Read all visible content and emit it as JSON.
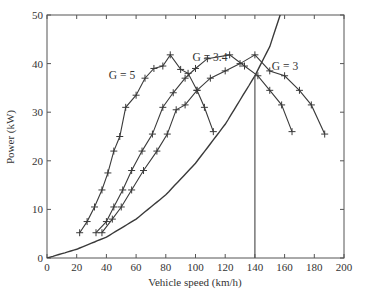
{
  "chart_data": {
    "type": "line",
    "title": "",
    "xlabel": "Vehicle speed (km/h)",
    "ylabel": "Power (kW)",
    "xlim": [
      0,
      200
    ],
    "ylim": [
      0,
      50
    ],
    "xticks": [
      0,
      20,
      40,
      60,
      80,
      100,
      120,
      140,
      160,
      180,
      200
    ],
    "yticks": [
      0,
      10,
      20,
      30,
      40,
      50
    ],
    "grid": false,
    "legend": "none (curves labeled inline)",
    "series": [
      {
        "name": "G = 5",
        "label": "G = 5",
        "marker": "+",
        "x": [
          22,
          27,
          32,
          37,
          41,
          45,
          49,
          53,
          60,
          66,
          72,
          78,
          83,
          90,
          95,
          101,
          106,
          112
        ],
        "y": [
          5.2,
          7.5,
          10.5,
          14,
          17.5,
          22,
          25,
          31,
          33.5,
          37,
          39,
          39.5,
          41.8,
          38.8,
          38,
          34.5,
          31,
          26
        ]
      },
      {
        "name": "G = 3.4",
        "label": "G = 3.4",
        "marker": "+",
        "x": [
          33,
          40,
          45,
          51,
          57,
          64,
          71,
          78,
          85,
          93,
          100,
          108,
          123,
          133,
          142,
          150,
          158,
          165
        ],
        "y": [
          5.2,
          7.5,
          10.5,
          14,
          18,
          22,
          25.5,
          31,
          34,
          37,
          39,
          41,
          41.8,
          39.5,
          37.5,
          34.5,
          31.5,
          26
        ]
      },
      {
        "name": "G = 3",
        "label": "G = 3",
        "marker": "+",
        "x": [
          37,
          44,
          50,
          57,
          65,
          74,
          81,
          87,
          93,
          101,
          110,
          120,
          130,
          140,
          150,
          160,
          170,
          178,
          187
        ],
        "y": [
          5.2,
          8,
          10.5,
          14,
          18,
          22,
          25.5,
          30.5,
          31.5,
          34.5,
          37,
          38.5,
          40,
          41.8,
          38.5,
          37.5,
          34.5,
          31.5,
          25.5
        ]
      },
      {
        "name": "Road load power",
        "label": "",
        "marker": "none",
        "x": [
          0,
          20,
          40,
          60,
          80,
          100,
          120,
          140,
          150,
          157
        ],
        "y": [
          0,
          1.8,
          4.3,
          8,
          13,
          19.5,
          27.5,
          37.5,
          43.5,
          50
        ]
      }
    ],
    "annotations": [
      {
        "type": "vline",
        "x": 140,
        "from_y": 0,
        "to_y": 37.5,
        "note": "max speed at intersection with road load curve"
      }
    ]
  }
}
